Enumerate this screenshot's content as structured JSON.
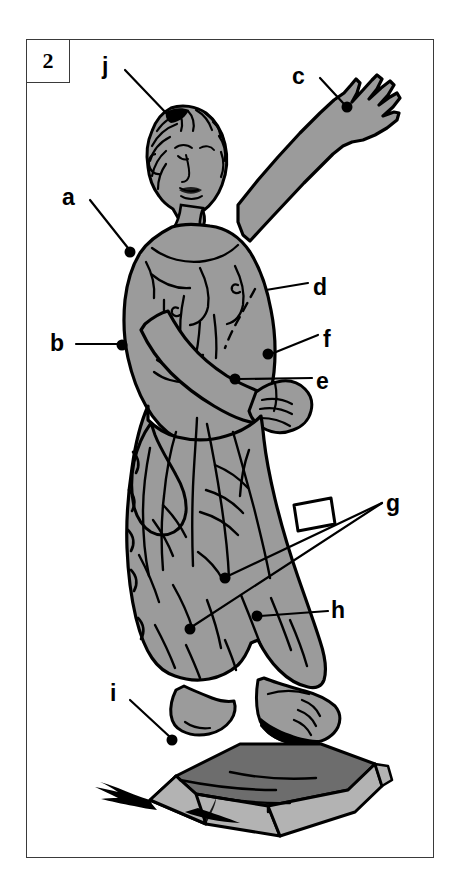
{
  "figure": {
    "number": "2",
    "title_present": false,
    "background_color": "#ffffff",
    "frame_color": "#3a3a3a",
    "statue_fill": "#9b9b9b",
    "plinth_top_fill": "#6d6d6d",
    "plinth_side_fill": "#b3b3b3",
    "ink_color": "#000000"
  },
  "labels": [
    {
      "id": "a",
      "text": "a",
      "x": 68,
      "y": 186,
      "dot_x": 130,
      "dot_y": 252,
      "leader": "diagonal-down-right"
    },
    {
      "id": "b",
      "text": "b",
      "x": 53,
      "y": 334,
      "dot_x": 122,
      "dot_y": 345,
      "leader": "horizontal-right"
    },
    {
      "id": "c",
      "text": "c",
      "x": 295,
      "y": 66,
      "dot_x": 347,
      "dot_y": 107,
      "leader": "diagonal-down-right"
    },
    {
      "id": "d",
      "text": "d",
      "x": 315,
      "y": 278,
      "dot_x": 263,
      "dot_y": 290,
      "leader": "horizontal-left"
    },
    {
      "id": "e",
      "text": "e",
      "x": 318,
      "y": 372,
      "dot_x": 235,
      "dot_y": 379,
      "leader": "horizontal-left"
    },
    {
      "id": "f",
      "text": "f",
      "x": 323,
      "y": 332,
      "dot_x": 268,
      "dot_y": 354,
      "leader": "diagonal-up-right"
    },
    {
      "id": "g",
      "text": "g",
      "x": 388,
      "y": 495,
      "dot_x": 225,
      "dot_y": 578,
      "leader": "long-diagonal-with-white-callout"
    },
    {
      "id": "h",
      "text": "h",
      "x": 333,
      "y": 602,
      "dot_x": 257,
      "dot_y": 616,
      "leader": "horizontal-left"
    },
    {
      "id": "i",
      "text": "i",
      "x": 112,
      "y": 685,
      "dot_x": 172,
      "dot_y": 740,
      "leader": "diagonal-down-right"
    },
    {
      "id": "j",
      "text": "j",
      "x": 104,
      "y": 57,
      "dot_x": 170,
      "dot_y": 117,
      "leader": "diagonal-down-right"
    }
  ]
}
